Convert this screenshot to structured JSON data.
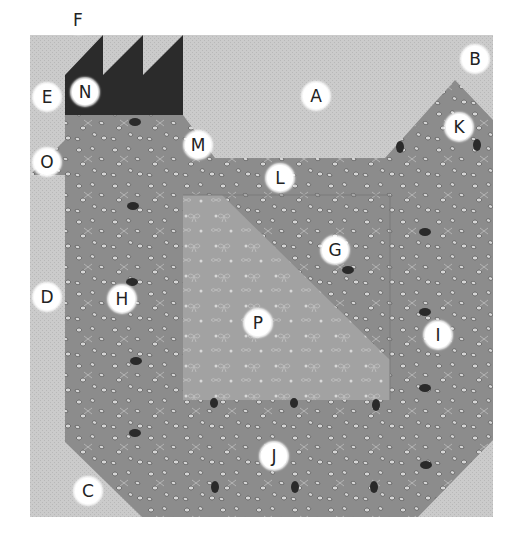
{
  "diagram": {
    "type": "quilt-block-piecing-diagram",
    "colors": {
      "background_light": "#c9c9c9",
      "body_print": "#8e8e8e",
      "comb_dark": "#2b2b2b",
      "p_print": "#a3a3a3",
      "label_bg": "#ffffff",
      "label_text": "#222222"
    },
    "pieces": [
      {
        "id": "A",
        "label": "A"
      },
      {
        "id": "B",
        "label": "B"
      },
      {
        "id": "C",
        "label": "C"
      },
      {
        "id": "D",
        "label": "D"
      },
      {
        "id": "E",
        "label": "E"
      },
      {
        "id": "F",
        "label": "F"
      },
      {
        "id": "G",
        "label": "G"
      },
      {
        "id": "H",
        "label": "H"
      },
      {
        "id": "I",
        "label": "I"
      },
      {
        "id": "J",
        "label": "J"
      },
      {
        "id": "K",
        "label": "K"
      },
      {
        "id": "L",
        "label": "L"
      },
      {
        "id": "M",
        "label": "M"
      },
      {
        "id": "N",
        "label": "N"
      },
      {
        "id": "O",
        "label": "O"
      },
      {
        "id": "P",
        "label": "P"
      }
    ]
  }
}
